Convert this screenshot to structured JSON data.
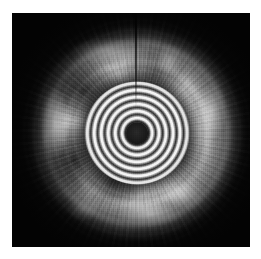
{
  "figure": {
    "kind": "grayscale-medical-ultrasound-image",
    "modality_label": "intravascular-ultrasound-cross-section",
    "canvas": {
      "width_px": 261,
      "height_px": 259,
      "page_background": "#ffffff"
    },
    "scan_frame": {
      "left_px": 12,
      "top_px": 13,
      "width_px": 238,
      "height_px": 234,
      "background": "#050505",
      "border_style": "none"
    },
    "colors": {
      "page": "#ffffff",
      "frame_black": "#050505",
      "tissue_bright": "#ffffff",
      "tissue_mid": "#8d8d8d",
      "tissue_dark": "#2a2a2a",
      "catheter_core": "#0a0a0a"
    },
    "features": {
      "center_x_pct": 52.5,
      "center_y_pct": 51.3,
      "catheter_core_diameter_pct": 9.2,
      "ringdown_rings_diameter_pct": 44,
      "vessel_wall_outer_diameter_pct": 70,
      "seam_artifact_x_pct": 51.8,
      "seam_artifact_height_pct": 40
    },
    "labels": {
      "overlay_text": "",
      "scale_bar": "",
      "caption": ""
    }
  }
}
